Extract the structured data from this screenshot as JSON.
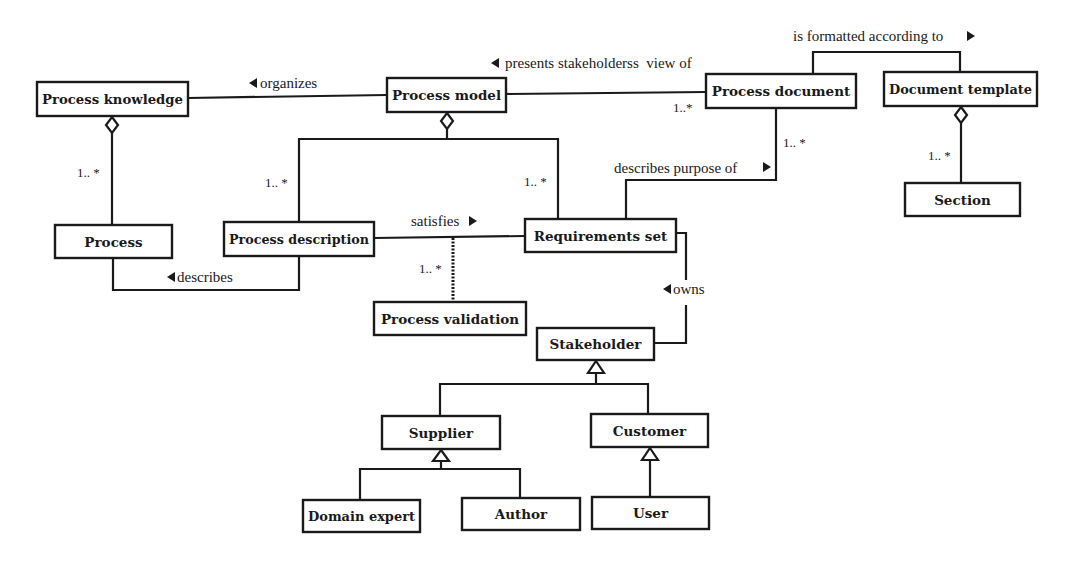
{
  "diagram": {
    "type": "UML class diagram",
    "classes": [
      {
        "id": "process-knowledge",
        "label": "Process knowledge",
        "x": 37,
        "y": 82,
        "w": 151,
        "h": 34
      },
      {
        "id": "process-model",
        "label": "Process model",
        "x": 387,
        "y": 78,
        "w": 119,
        "h": 34
      },
      {
        "id": "process-document",
        "label": "Process document",
        "x": 706,
        "y": 74,
        "w": 150,
        "h": 34
      },
      {
        "id": "document-template",
        "label": "Document template",
        "x": 884,
        "y": 72,
        "w": 153,
        "h": 34
      },
      {
        "id": "section",
        "label": "Section",
        "x": 905,
        "y": 183,
        "w": 115,
        "h": 33
      },
      {
        "id": "process",
        "label": "Process",
        "x": 55,
        "y": 225,
        "w": 117,
        "h": 33
      },
      {
        "id": "process-description",
        "label": "Process description",
        "x": 224,
        "y": 222,
        "w": 150,
        "h": 34
      },
      {
        "id": "requirements-set",
        "label": "Requirements set",
        "x": 525,
        "y": 219,
        "w": 151,
        "h": 33
      },
      {
        "id": "process-validation",
        "label": "Process validation",
        "x": 374,
        "y": 302,
        "w": 152,
        "h": 33
      },
      {
        "id": "stakeholder",
        "label": "Stakeholder",
        "x": 537,
        "y": 328,
        "w": 117,
        "h": 32
      },
      {
        "id": "supplier",
        "label": "Supplier",
        "x": 382,
        "y": 416,
        "w": 118,
        "h": 33
      },
      {
        "id": "customer",
        "label": "Customer",
        "x": 591,
        "y": 414,
        "w": 117,
        "h": 33
      },
      {
        "id": "domain-expert",
        "label": "Domain expert",
        "x": 303,
        "y": 500,
        "w": 117,
        "h": 32
      },
      {
        "id": "author",
        "label": "Author",
        "x": 462,
        "y": 498,
        "w": 118,
        "h": 32
      },
      {
        "id": "user",
        "label": "User",
        "x": 592,
        "y": 497,
        "w": 117,
        "h": 32
      }
    ],
    "associations": [
      {
        "id": "organizes",
        "label": "organizes",
        "direction": "left",
        "from": "process-model",
        "to": "process-knowledge",
        "label_x": 255,
        "label_y": 88
      },
      {
        "id": "presents-view",
        "label": "presents stakeholderss  view of",
        "direction": "left",
        "from": "process-document",
        "to": "process-model",
        "label_x": 520,
        "label_y": 67
      },
      {
        "id": "is-formatted",
        "label": "is formatted according to",
        "direction": "right",
        "from": "process-document",
        "to": "document-template",
        "label_x": 793,
        "label_y": 41
      },
      {
        "id": "describes-purpose",
        "label": "describes purpose of",
        "direction": "right",
        "from": "requirements-set",
        "to": "process-document",
        "label_x": 614,
        "label_y": 173
      },
      {
        "id": "satisfies",
        "label": "satisfies",
        "direction": "right",
        "from": "process-description",
        "to": "requirements-set",
        "label_x": 411,
        "label_y": 227
      },
      {
        "id": "describes",
        "label": "describes",
        "direction": "left",
        "from": "process-description",
        "to": "process",
        "label_x": 178,
        "label_y": 282
      },
      {
        "id": "owns",
        "label": "owns",
        "direction": "left",
        "from": "stakeholder",
        "to": "requirements-set",
        "label_x": 663,
        "label_y": 295
      }
    ],
    "multiplicities": [
      {
        "id": "mult-process",
        "label": "1.. *",
        "x": 77,
        "y": 177
      },
      {
        "id": "mult-process-description",
        "label": "1.. *",
        "x": 265,
        "y": 187
      },
      {
        "id": "mult-requirements-set",
        "label": "1.. *",
        "x": 524,
        "y": 186
      },
      {
        "id": "mult-process-document-left",
        "label": "1..*",
        "x": 673,
        "y": 112
      },
      {
        "id": "mult-process-document-bottom",
        "label": "1.. *",
        "x": 783,
        "y": 147
      },
      {
        "id": "mult-section",
        "label": "1.. *",
        "x": 928,
        "y": 160
      },
      {
        "id": "mult-process-validation",
        "label": "1.. *",
        "x": 419,
        "y": 273
      }
    ],
    "aggregations": [
      {
        "id": "agg-knowledge-process",
        "whole": "process-knowledge",
        "part": "process"
      },
      {
        "id": "agg-model-description-requirements",
        "whole": "process-model",
        "parts": [
          "process-description",
          "requirements-set"
        ]
      },
      {
        "id": "agg-template-section",
        "whole": "document-template",
        "part": "section"
      }
    ],
    "generalizations": [
      {
        "id": "gen-stakeholder",
        "parent": "stakeholder",
        "children": [
          "supplier",
          "customer"
        ]
      },
      {
        "id": "gen-supplier",
        "parent": "supplier",
        "children": [
          "domain-expert",
          "author"
        ]
      },
      {
        "id": "gen-customer",
        "parent": "customer",
        "children": [
          "user"
        ]
      }
    ],
    "association_class_link": {
      "id": "satisfies-validation",
      "from": "satisfies",
      "to": "process-validation",
      "style": "dotted"
    }
  },
  "colors": {
    "background": "#ffffff",
    "line": "#1a1a1a"
  }
}
